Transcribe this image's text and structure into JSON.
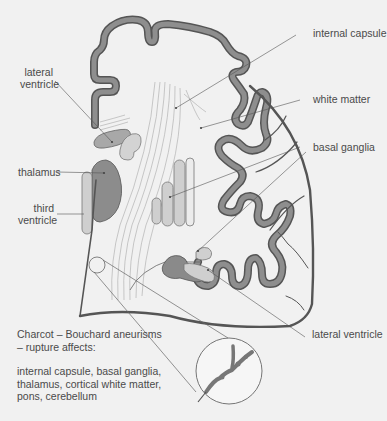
{
  "diagram": {
    "labels": {
      "internal_capsule": "internal capsule",
      "white_matter": "white matter",
      "basal_ganglia": "basal ganglia",
      "lateral_ventricle_top_line1": "lateral",
      "lateral_ventricle_top_line2": "ventricle",
      "thalamus": "thalamus",
      "third_ventricle_line1": "third",
      "third_ventricle_line2": "ventricle",
      "lateral_ventricle_bottom": "lateral ventricle"
    },
    "note": {
      "line1": "Charcot – Bouchard aneurisms",
      "line2": "– rupture affects:",
      "line3": "internal capsule, basal ganglia,",
      "line4": "thalamus, cortical white matter,",
      "line5": "pons, cerebellum"
    },
    "colors": {
      "background": "#f1f1f1",
      "cortex_fill": "#8e8e8e",
      "cortex_outline": "#555555",
      "light_structure": "#cfcfcf",
      "dark_structure": "#8a8a8a",
      "leader_line": "#555555",
      "text": "#4a4a4a"
    }
  }
}
